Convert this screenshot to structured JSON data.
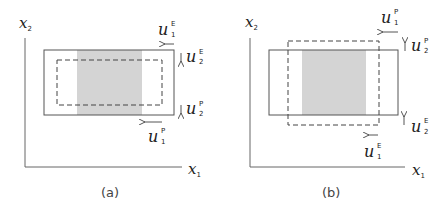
{
  "figure": {
    "panels": [
      {
        "id": "a",
        "caption": "(a)",
        "axes": {
          "x_label": "x",
          "x_sub": "1",
          "y_label": "x",
          "y_sub": "2"
        },
        "labels": {
          "u1_top": {
            "base": "u",
            "sub": "1",
            "sup": "E"
          },
          "u2_top": {
            "base": "u",
            "sub": "2",
            "sup": "E"
          },
          "u2_bottom": {
            "base": "u",
            "sub": "2",
            "sup": "P"
          },
          "u1_bottom": {
            "base": "u",
            "sub": "1",
            "sup": "P"
          }
        },
        "description": "Solid rectangle with dashed rectangle inside (shrunk); shaded central band"
      },
      {
        "id": "b",
        "caption": "(b)",
        "axes": {
          "x_label": "x",
          "x_sub": "1",
          "y_label": "x",
          "y_sub": "2"
        },
        "labels": {
          "u1_top": {
            "base": "u",
            "sub": "1",
            "sup": "P"
          },
          "u2_top": {
            "base": "u",
            "sub": "2",
            "sup": "P"
          },
          "u2_bottom": {
            "base": "u",
            "sub": "2",
            "sup": "E"
          },
          "u1_bottom": {
            "base": "u",
            "sub": "1",
            "sup": "E"
          }
        },
        "description": "Solid rectangle with dashed rectangle extending beyond it vertically; shaded central band"
      }
    ],
    "colors": {
      "line": "#555555",
      "shade": "#d4d4d4",
      "dash": "#444444"
    }
  }
}
